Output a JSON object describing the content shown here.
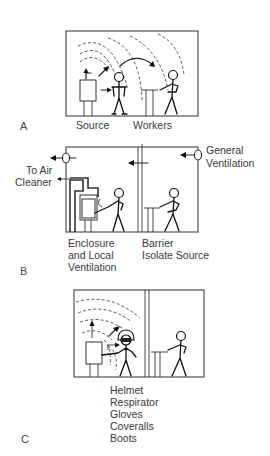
{
  "panels": [
    {
      "id": "A",
      "letter": "A",
      "labels": {
        "source": "Source",
        "workers": "Workers"
      }
    },
    {
      "id": "B",
      "letter": "B",
      "labels": {
        "to_air_line1": "To Air",
        "to_air_line2": "Cleaner",
        "general_line1": "General",
        "general_line2": "Ventilation",
        "enclosure_line1": "Enclosure",
        "enclosure_line2": "and Local",
        "enclosure_line3": "Ventilation",
        "barrier_line1": "Barrier",
        "barrier_line2": "Isolate Source"
      }
    },
    {
      "id": "C",
      "letter": "C",
      "ppe_items": [
        "Helmet",
        "Respirator",
        "Gloves",
        "Coveralls",
        "Boots"
      ]
    }
  ],
  "colors": {
    "line": "#222222",
    "text": "#3a3a3a",
    "background": "#ffffff"
  }
}
